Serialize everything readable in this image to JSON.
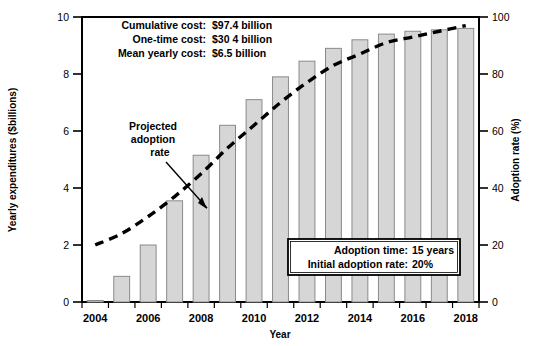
{
  "chart_data": {
    "type": "bar",
    "title": "",
    "xlabel": "Year",
    "ylabel": "Yearly expenditures ($billions)",
    "y2label": "Adoption rate (%)",
    "ylim": [
      0,
      10
    ],
    "y2lim": [
      0,
      100
    ],
    "grid": false,
    "legend_position": "none",
    "categories": [
      "2004",
      "2005",
      "2006",
      "2007",
      "2008",
      "2009",
      "2010",
      "2011",
      "2012",
      "2013",
      "2014",
      "2015",
      "2016",
      "2017",
      "2018"
    ],
    "xtick_labels": [
      "2004",
      "2006",
      "2008",
      "2010",
      "2012",
      "2014",
      "2016",
      "2018"
    ],
    "ytick_labels": [
      "0",
      "2",
      "4",
      "6",
      "8",
      "10"
    ],
    "ytick_values": [
      0,
      2,
      4,
      6,
      8,
      10
    ],
    "y2tick_labels": [
      "0",
      "20",
      "40",
      "60",
      "80",
      "100"
    ],
    "y2tick_values": [
      0,
      20,
      40,
      60,
      80,
      100
    ],
    "series": [
      {
        "name": "Yearly expenditures ($billions)",
        "type": "bar",
        "axis": "left",
        "values": [
          0.05,
          0.9,
          2.0,
          3.55,
          5.15,
          6.2,
          7.1,
          7.9,
          8.45,
          8.9,
          9.2,
          9.4,
          9.5,
          9.55,
          9.6
        ]
      },
      {
        "name": "Projected adoption rate",
        "type": "line",
        "style": "dashed",
        "axis": "right",
        "values": [
          20,
          24,
          30,
          37,
          45,
          54,
          62,
          70,
          77,
          83,
          87,
          91,
          93,
          95,
          97
        ]
      }
    ],
    "annotations": [
      {
        "name": "cumulative-cost",
        "label": "Cumulative cost:",
        "value": "$97.4 billion"
      },
      {
        "name": "one-time-cost",
        "label": "One-time cost:",
        "value": "$30 4 billion"
      },
      {
        "name": "mean-yearly-cost",
        "label": "Mean yearly cost:",
        "value": "$6.5 billion"
      }
    ],
    "pointer_label": [
      "Projected",
      "adoption",
      "rate"
    ],
    "callout": [
      {
        "name": "adoption-time",
        "label": "Adoption time:",
        "value": "15 years"
      },
      {
        "name": "initial-adoption-rate",
        "label": "Initial adoption rate:",
        "value": "20%"
      }
    ],
    "colors": {
      "bar_fill": "#d6d6d6",
      "bar_stroke": "#8a8a8a",
      "line": "#000000",
      "axis": "#000000",
      "background": "#ffffff"
    }
  }
}
